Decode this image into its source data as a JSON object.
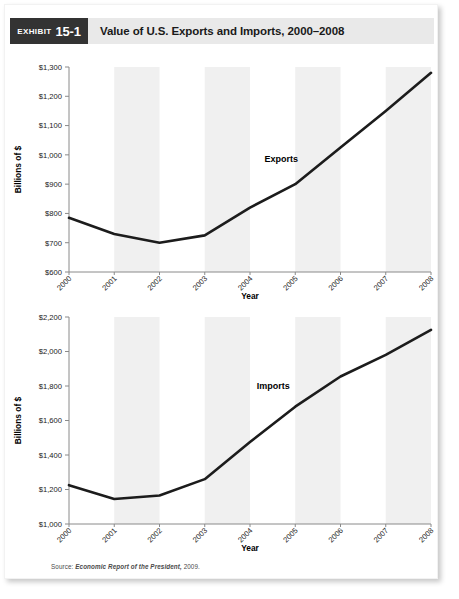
{
  "header": {
    "badge_word": "Exhibit",
    "badge_number": "15-1",
    "title": "Value of U.S. Exports and Imports, 2000–2008"
  },
  "source": {
    "label": "Source:",
    "publication": "Economic Report of the President,",
    "year": "2009."
  },
  "colors": {
    "badge_bg": "#333333",
    "header_bg": "#e9e9e9",
    "band": "#f0f0f0",
    "line": "#1c1c1c",
    "axis": "#8a8a8a",
    "card_bg": "#ffffff"
  },
  "chart_data": [
    {
      "type": "line",
      "title": "Value of U.S. Exports, 2000–2008",
      "series_label": "Exports",
      "xlabel": "Year",
      "ylabel": "Billions of $",
      "categories": [
        "2000",
        "2001",
        "2002",
        "2003",
        "2004",
        "2005",
        "2006",
        "2007",
        "2008"
      ],
      "x": [
        2000,
        2001,
        2002,
        2003,
        2004,
        2005,
        2006,
        2007,
        2008
      ],
      "values": [
        785,
        730,
        700,
        725,
        820,
        900,
        1025,
        1150,
        1280
      ],
      "ylim": [
        600,
        1300
      ],
      "ytick_values": [
        600,
        700,
        800,
        900,
        1000,
        1100,
        1200,
        1300
      ],
      "ytick_labels": [
        "$600",
        "$700",
        "$800",
        "$900",
        "$1,000",
        "$1,100",
        "$1,200",
        "$1,300"
      ],
      "grid": false,
      "legend": "none",
      "banded_background": true
    },
    {
      "type": "line",
      "title": "Value of U.S. Imports, 2000–2008",
      "series_label": "Imports",
      "xlabel": "Year",
      "ylabel": "Billions of $",
      "categories": [
        "2000",
        "2001",
        "2002",
        "2003",
        "2004",
        "2005",
        "2006",
        "2007",
        "2008"
      ],
      "x": [
        2000,
        2001,
        2002,
        2003,
        2004,
        2005,
        2006,
        2007,
        2008
      ],
      "values": [
        1225,
        1145,
        1165,
        1260,
        1475,
        1680,
        1855,
        1980,
        2125
      ],
      "ylim": [
        1000,
        2200
      ],
      "ytick_values": [
        1000,
        1200,
        1400,
        1600,
        1800,
        2000,
        2200
      ],
      "ytick_labels": [
        "$1,000",
        "$1,200",
        "$1,400",
        "$1,600",
        "$1,800",
        "$2,000",
        "$2,200"
      ],
      "grid": false,
      "legend": "none",
      "banded_background": true
    }
  ]
}
